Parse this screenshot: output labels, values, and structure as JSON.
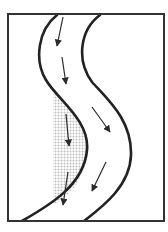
{
  "diagram": {
    "title": "",
    "type": "meandering-river-channel",
    "colors": {
      "frame": "#333333",
      "banks": "#222222",
      "arrows": "#2a2a2a",
      "deposit_dots": "#bdbdbd",
      "background": "#ffffff"
    },
    "frame": {
      "x": 8,
      "y": 14,
      "width": 156,
      "height": 207
    },
    "banks": [
      {
        "id": "left-bank",
        "path": "M57,15 C38,30 34,60 46,80 C56,98 90,120 87,150 C84,185 50,205 22,221"
      },
      {
        "id": "right-bank",
        "path": "M100,15 C80,30 76,60 92,82 C108,100 132,120 131,155 C130,185 105,205 84,221"
      }
    ],
    "deposit": {
      "label": "point-bar",
      "path": "M53,90 C64,104 88,122 87,150 C86,178 70,196 53,205 Z"
    },
    "flow_arrows": [
      {
        "x1": 63,
        "y1": 17,
        "x2": 57,
        "y2": 46
      },
      {
        "x1": 62,
        "y1": 57,
        "x2": 66,
        "y2": 84
      },
      {
        "x1": 66,
        "y1": 114,
        "x2": 69,
        "y2": 146
      },
      {
        "x1": 92,
        "y1": 107,
        "x2": 110,
        "y2": 132
      },
      {
        "x1": 106,
        "y1": 162,
        "x2": 92,
        "y2": 191
      },
      {
        "x1": 68,
        "y1": 172,
        "x2": 63,
        "y2": 205
      }
    ]
  }
}
